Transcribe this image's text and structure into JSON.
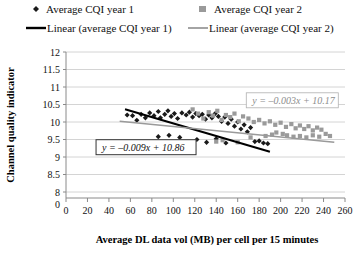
{
  "legend": {
    "position": "top",
    "entries": [
      {
        "label": "Average CQI year 1",
        "marker": "diamond-marker-icon",
        "color": "#1a1a1a"
      },
      {
        "label": "Average CQI year 2",
        "marker": "square-marker-icon",
        "color": "#9a9a9a"
      },
      {
        "label": "Linear (average CQI year 1)",
        "marker": "line-marker-icon",
        "color": "#000000"
      },
      {
        "label": "Linear (average CQI year 2)",
        "marker": "line-marker-icon",
        "color": "#9a9a9a"
      }
    ]
  },
  "annotations": [
    {
      "name": "equation-year2",
      "text": "y = –0.003x + 10.17",
      "color": "#8d8d8d",
      "x": 168,
      "y": 10.62
    },
    {
      "name": "equation-year1",
      "text": "y = –0.009x + 10.86",
      "color": "#111111",
      "x": 28,
      "y": 9.28
    }
  ],
  "chart_data": {
    "type": "scatter",
    "title": "",
    "xlabel": "Average DL data vol (MB) per cell per 15 minutes",
    "ylabel": "Channel quality indicator",
    "xlim": [
      0,
      260
    ],
    "ylim": [
      8,
      12
    ],
    "y_axis_break": true,
    "y_axis_origin_label": "0",
    "xticks": [
      0,
      20,
      40,
      60,
      80,
      100,
      120,
      140,
      160,
      180,
      200,
      220,
      240,
      260
    ],
    "yticks": [
      8,
      8.5,
      9,
      9.5,
      10,
      10.5,
      11,
      11.5,
      12
    ],
    "ytick_labels": [
      "8",
      "8.5",
      "9",
      "9.5",
      "10",
      "10.5",
      "11",
      "11.5",
      "12"
    ],
    "xtick_labels": [
      "0",
      "20",
      "40",
      "60",
      "80",
      "100",
      "120",
      "140",
      "160",
      "180",
      "200",
      "220",
      "240",
      "260"
    ],
    "grid": "horizontal",
    "legend_position": "top",
    "series": [
      {
        "name": "Average CQI year 1",
        "marker": "diamond",
        "color": "#1a1a1a",
        "points": [
          [
            57,
            10.2
          ],
          [
            62,
            10.18
          ],
          [
            66,
            10.05
          ],
          [
            70,
            10.22
          ],
          [
            74,
            10.12
          ],
          [
            78,
            10.26
          ],
          [
            82,
            10.18
          ],
          [
            86,
            10.3
          ],
          [
            88,
            10.12
          ],
          [
            92,
            10.22
          ],
          [
            95,
            10.32
          ],
          [
            98,
            10.16
          ],
          [
            101,
            10.24
          ],
          [
            104,
            10.1
          ],
          [
            108,
            10.26
          ],
          [
            112,
            10.2
          ],
          [
            115,
            10.28
          ],
          [
            118,
            10.14
          ],
          [
            121,
            10.24
          ],
          [
            124,
            10.18
          ],
          [
            127,
            10.22
          ],
          [
            130,
            10.08
          ],
          [
            133,
            10.2
          ],
          [
            136,
            10.12
          ],
          [
            139,
            10.24
          ],
          [
            142,
            10.16
          ],
          [
            145,
            10.02
          ],
          [
            148,
            10.14
          ],
          [
            151,
            9.96
          ],
          [
            154,
            10.08
          ],
          [
            157,
            9.88
          ],
          [
            160,
            10.0
          ],
          [
            163,
            9.8
          ],
          [
            166,
            9.92
          ],
          [
            169,
            9.72
          ],
          [
            172,
            9.84
          ],
          [
            122,
            9.5
          ],
          [
            131,
            9.42
          ],
          [
            140,
            9.52
          ],
          [
            149,
            9.4
          ],
          [
            176,
            9.44
          ],
          [
            180,
            9.46
          ],
          [
            184,
            9.4
          ],
          [
            188,
            9.38
          ],
          [
            106,
            9.56
          ],
          [
            96,
            9.62
          ],
          [
            86,
            9.58
          ]
        ]
      },
      {
        "name": "Average CQI year 2",
        "marker": "square",
        "color": "#9a9a9a",
        "points": [
          [
            118,
            10.36
          ],
          [
            123,
            10.24
          ],
          [
            128,
            10.1
          ],
          [
            133,
            10.28
          ],
          [
            137,
            10.18
          ],
          [
            141,
            10.32
          ],
          [
            145,
            10.06
          ],
          [
            149,
            10.2
          ],
          [
            153,
            10.14
          ],
          [
            157,
            10.24
          ],
          [
            161,
            10.02
          ],
          [
            165,
            10.16
          ],
          [
            140,
            9.44
          ],
          [
            146,
            9.48
          ],
          [
            170,
            10.1
          ],
          [
            175,
            10.0
          ],
          [
            180,
            10.06
          ],
          [
            185,
            9.96
          ],
          [
            190,
            10.02
          ],
          [
            195,
            9.92
          ],
          [
            200,
            9.98
          ],
          [
            205,
            9.86
          ],
          [
            210,
            9.94
          ],
          [
            214,
            9.82
          ],
          [
            218,
            9.9
          ],
          [
            222,
            9.8
          ],
          [
            226,
            9.88
          ],
          [
            230,
            9.76
          ],
          [
            234,
            9.84
          ],
          [
            238,
            9.78
          ],
          [
            206,
            9.62
          ],
          [
            212,
            9.58
          ],
          [
            218,
            9.6
          ],
          [
            224,
            9.56
          ],
          [
            230,
            9.62
          ],
          [
            236,
            9.58
          ],
          [
            242,
            9.66
          ],
          [
            246,
            9.6
          ],
          [
            192,
            9.64
          ],
          [
            186,
            9.6
          ],
          [
            160,
            9.42
          ],
          [
            196,
            9.7
          ],
          [
            202,
            9.66
          ],
          [
            172,
            9.56
          ]
        ]
      }
    ],
    "trendlines": [
      {
        "name": "Linear (average CQI year 1)",
        "equation": "y = –0.009x + 10.86",
        "slope": -0.009,
        "intercept": 10.86,
        "color": "#000000",
        "width": 2,
        "x_start": 55,
        "x_end": 190
      },
      {
        "name": "Linear (average CQI year 2)",
        "equation": "y = –0.003x + 10.17",
        "slope": -0.003,
        "intercept": 10.17,
        "color": "#9a9a9a",
        "width": 1.6,
        "x_start": 50,
        "x_end": 250
      }
    ]
  }
}
